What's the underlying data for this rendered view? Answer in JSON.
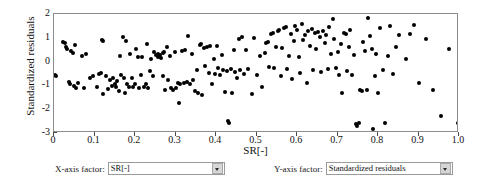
{
  "chart_data": {
    "type": "scatter",
    "title": "",
    "xlabel": "SR[-]",
    "ylabel": "Standardized residuals",
    "xlim": [
      0,
      1
    ],
    "ylim": [
      -3,
      2
    ],
    "grid": false,
    "legend": null,
    "xticks": [
      "0",
      "0.1",
      "0.2",
      "0.3",
      "0.4",
      "0.5",
      "0.6",
      "0.7",
      "0.8",
      "0.9",
      "1.0"
    ],
    "xtick_values": [
      0,
      0.1,
      0.2,
      0.3,
      0.4,
      0.5,
      0.6,
      0.7,
      0.8,
      0.9,
      1.0
    ],
    "yticks": [
      "2",
      "1",
      "0",
      "-1",
      "-2",
      "-3"
    ],
    "ytick_values": [
      2,
      1,
      0,
      -1,
      -2,
      -3
    ],
    "marker": "filled-circle",
    "marker_color": "#000000",
    "points": [
      [
        0.002,
        -0.55
      ],
      [
        0.006,
        -0.62
      ],
      [
        0.022,
        0.84
      ],
      [
        0.027,
        0.78
      ],
      [
        0.03,
        0.6
      ],
      [
        0.033,
        0.55
      ],
      [
        0.036,
        -0.86
      ],
      [
        0.04,
        -0.93
      ],
      [
        0.042,
        0.46
      ],
      [
        0.046,
        0.38
      ],
      [
        0.05,
        -1.02
      ],
      [
        0.052,
        0.7
      ],
      [
        0.055,
        -1.12
      ],
      [
        0.06,
        -0.88
      ],
      [
        0.07,
        0.23
      ],
      [
        0.075,
        -1.1
      ],
      [
        0.08,
        0.33
      ],
      [
        0.09,
        -0.7
      ],
      [
        0.096,
        -0.62
      ],
      [
        0.105,
        -1.08
      ],
      [
        0.112,
        -0.52
      ],
      [
        0.115,
        -0.48
      ],
      [
        0.118,
        0.92
      ],
      [
        0.12,
        0.88
      ],
      [
        0.122,
        -1.38
      ],
      [
        0.128,
        -0.6
      ],
      [
        0.133,
        -1.16
      ],
      [
        0.138,
        -0.78
      ],
      [
        0.142,
        -1.02
      ],
      [
        0.146,
        -0.7
      ],
      [
        0.15,
        -0.95
      ],
      [
        0.152,
        -1.05
      ],
      [
        0.156,
        -0.82
      ],
      [
        0.16,
        -1.22
      ],
      [
        0.163,
        0.22
      ],
      [
        0.166,
        -0.58
      ],
      [
        0.17,
        1.02
      ],
      [
        0.172,
        -0.7
      ],
      [
        0.175,
        -1.3
      ],
      [
        0.178,
        0.88
      ],
      [
        0.18,
        -0.96
      ],
      [
        0.184,
        -1.05
      ],
      [
        0.188,
        0.3
      ],
      [
        0.192,
        -0.7
      ],
      [
        0.196,
        -1.08
      ],
      [
        0.2,
        -0.92
      ],
      [
        0.203,
        0.55
      ],
      [
        0.207,
        0.2
      ],
      [
        0.21,
        -1.1
      ],
      [
        0.214,
        -0.55
      ],
      [
        0.218,
        0.18
      ],
      [
        0.222,
        -1.06
      ],
      [
        0.226,
        -0.96
      ],
      [
        0.23,
        0.72
      ],
      [
        0.233,
        -1.12
      ],
      [
        0.237,
        -0.4
      ],
      [
        0.24,
        0.12
      ],
      [
        0.244,
        -0.6
      ],
      [
        0.248,
        0.4
      ],
      [
        0.252,
        0.28
      ],
      [
        0.256,
        0.18
      ],
      [
        0.258,
        0.32
      ],
      [
        0.26,
        0.22
      ],
      [
        0.262,
        0.26
      ],
      [
        0.265,
        0.15
      ],
      [
        0.268,
        0.36
      ],
      [
        0.27,
        -0.62
      ],
      [
        0.272,
        0.42
      ],
      [
        0.275,
        -1.18
      ],
      [
        0.278,
        0.62
      ],
      [
        0.282,
        -0.78
      ],
      [
        0.286,
        0.24
      ],
      [
        0.29,
        -1.12
      ],
      [
        0.294,
        -1.2
      ],
      [
        0.298,
        0.4
      ],
      [
        0.302,
        -1.1
      ],
      [
        0.306,
        -0.88
      ],
      [
        0.308,
        -1.72
      ],
      [
        0.312,
        -0.95
      ],
      [
        0.316,
        0.44
      ],
      [
        0.32,
        -0.9
      ],
      [
        0.324,
        0.48
      ],
      [
        0.328,
        -0.85
      ],
      [
        0.332,
        1.06
      ],
      [
        0.336,
        -0.92
      ],
      [
        0.34,
        0.3
      ],
      [
        0.344,
        -0.78
      ],
      [
        0.348,
        -1.25
      ],
      [
        0.352,
        -0.35
      ],
      [
        0.356,
        -1.3
      ],
      [
        0.36,
        0.68
      ],
      [
        0.364,
        0.72
      ],
      [
        0.366,
        -1.42
      ],
      [
        0.37,
        0.58
      ],
      [
        0.374,
        -0.2
      ],
      [
        0.378,
        0.62
      ],
      [
        0.382,
        -0.48
      ],
      [
        0.386,
        0.66
      ],
      [
        0.39,
        -0.92
      ],
      [
        0.394,
        0.12
      ],
      [
        0.398,
        -0.52
      ],
      [
        0.402,
        0.64
      ],
      [
        0.406,
        -0.25
      ],
      [
        0.41,
        -0.55
      ],
      [
        0.414,
        0.26
      ],
      [
        0.418,
        -0.35
      ],
      [
        0.422,
        -1.28
      ],
      [
        0.426,
        -0.4
      ],
      [
        0.43,
        -2.48
      ],
      [
        0.432,
        -2.58
      ],
      [
        0.436,
        -0.3
      ],
      [
        0.44,
        -1.3
      ],
      [
        0.444,
        0.5
      ],
      [
        0.448,
        -0.42
      ],
      [
        0.452,
        -0.7
      ],
      [
        0.456,
        0.95
      ],
      [
        0.46,
        -0.35
      ],
      [
        0.464,
        1.02
      ],
      [
        0.468,
        -0.52
      ],
      [
        0.474,
        0.48
      ],
      [
        0.48,
        -0.3
      ],
      [
        0.488,
        -1.35
      ],
      [
        0.494,
        0.98
      ],
      [
        0.5,
        -0.58
      ],
      [
        0.508,
        0.22
      ],
      [
        0.514,
        -1.08
      ],
      [
        0.52,
        0.35
      ],
      [
        0.524,
        0.78
      ],
      [
        0.528,
        0.82
      ],
      [
        0.532,
        -0.22
      ],
      [
        0.536,
        1.18
      ],
      [
        0.54,
        1.22
      ],
      [
        0.544,
        -0.28
      ],
      [
        0.548,
        0.62
      ],
      [
        0.552,
        1.3
      ],
      [
        0.556,
        1.34
      ],
      [
        0.56,
        -0.6
      ],
      [
        0.564,
        0.58
      ],
      [
        0.568,
        1.42
      ],
      [
        0.572,
        1.46
      ],
      [
        0.576,
        -0.3
      ],
      [
        0.58,
        0.25
      ],
      [
        0.584,
        1.18
      ],
      [
        0.588,
        -0.72
      ],
      [
        0.592,
        0.88
      ],
      [
        0.596,
        1.5
      ],
      [
        0.6,
        1.32
      ],
      [
        0.604,
        0.2
      ],
      [
        0.608,
        -0.48
      ],
      [
        0.612,
        1.6
      ],
      [
        0.616,
        0.92
      ],
      [
        0.62,
        1.1
      ],
      [
        0.624,
        -0.88
      ],
      [
        0.628,
        1.28
      ],
      [
        0.632,
        0.66
      ],
      [
        0.636,
        1.38
      ],
      [
        0.64,
        -0.35
      ],
      [
        0.644,
        1.22
      ],
      [
        0.648,
        0.52
      ],
      [
        0.652,
        1.26
      ],
      [
        0.656,
        1.02
      ],
      [
        0.66,
        -0.42
      ],
      [
        0.664,
        1.3
      ],
      [
        0.668,
        0.78
      ],
      [
        0.672,
        1.12
      ],
      [
        0.676,
        -0.3
      ],
      [
        0.68,
        1.44
      ],
      [
        0.684,
        0.3
      ],
      [
        0.688,
        1.78
      ],
      [
        0.692,
        0.96
      ],
      [
        0.696,
        -0.25
      ],
      [
        0.7,
        0.42
      ],
      [
        0.704,
        -0.55
      ],
      [
        0.708,
        0.72
      ],
      [
        0.712,
        -1.32
      ],
      [
        0.716,
        1.2
      ],
      [
        0.72,
        1.16
      ],
      [
        0.724,
        -0.4
      ],
      [
        0.728,
        0.62
      ],
      [
        0.732,
        1.32
      ],
      [
        0.736,
        -0.58
      ],
      [
        0.74,
        0.28
      ],
      [
        0.745,
        -2.62
      ],
      [
        0.748,
        -2.7
      ],
      [
        0.752,
        -2.58
      ],
      [
        0.756,
        -1.2
      ],
      [
        0.76,
        -1.25
      ],
      [
        0.764,
        0.82
      ],
      [
        0.768,
        0.45
      ],
      [
        0.772,
        -1.18
      ],
      [
        0.776,
        1.82
      ],
      [
        0.78,
        1.06
      ],
      [
        0.784,
        0.52
      ],
      [
        0.788,
        -2.82
      ],
      [
        0.792,
        -0.62
      ],
      [
        0.796,
        0.3
      ],
      [
        0.8,
        -1.3
      ],
      [
        0.806,
        1.4
      ],
      [
        0.812,
        -0.35
      ],
      [
        0.818,
        -2.58
      ],
      [
        0.824,
        0.22
      ],
      [
        0.83,
        1.48
      ],
      [
        0.836,
        -0.52
      ],
      [
        0.845,
        0.6
      ],
      [
        0.852,
        1.1
      ],
      [
        0.86,
        -2.98
      ],
      [
        0.868,
        0.12
      ],
      [
        0.878,
        1.18
      ],
      [
        0.888,
        1.52
      ],
      [
        0.9,
        -0.88
      ],
      [
        0.918,
        0.96
      ],
      [
        0.935,
        -1.18
      ],
      [
        0.955,
        -2.3
      ],
      [
        0.975,
        0.52
      ],
      [
        0.998,
        -2.58
      ]
    ]
  },
  "controls": {
    "x_axis": {
      "label": "X-axis factor:",
      "value": "SR[-]"
    },
    "y_axis": {
      "label": "Y-axis factor:",
      "value": "Standardized residuals"
    }
  }
}
